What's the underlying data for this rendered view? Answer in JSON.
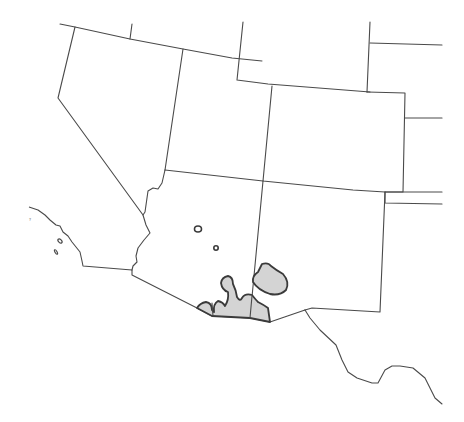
{
  "map": {
    "title": "",
    "region": "Southwestern United States and northern Mexico",
    "colors": {
      "background": "#ffffff",
      "border": "#4a4a4a",
      "range_fill": "#d4d4d4",
      "range_stroke": "#3a3a3a"
    },
    "legend": [],
    "states": [
      {
        "name": "Nevada"
      },
      {
        "name": "Utah"
      },
      {
        "name": "Colorado"
      },
      {
        "name": "Arizona"
      },
      {
        "name": "New Mexico"
      },
      {
        "name": "Idaho"
      },
      {
        "name": "Wyoming"
      },
      {
        "name": "California"
      }
    ],
    "range_features": [
      {
        "id": "main-range",
        "description": "Shaded distribution area along southern Arizona / Mexico border"
      },
      {
        "id": "sw-nm-range",
        "description": "Shaded distribution area in southwestern New Mexico"
      },
      {
        "id": "isolated-population-1",
        "description": "Small isolated outline in central Arizona"
      },
      {
        "id": "isolated-population-2",
        "description": "Small isolated outline in central Arizona"
      }
    ],
    "tiny_label": "?"
  }
}
